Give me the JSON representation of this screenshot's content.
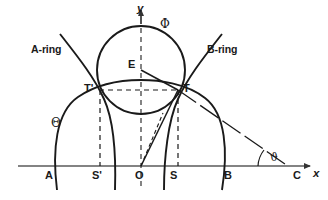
{
  "figure": {
    "kind": "geometry-diagram",
    "background_color": "#ffffff",
    "stroke_color": "#1a1a1a",
    "axis_color": "#555555"
  },
  "axes": {
    "x_label": "x",
    "y_label": "y",
    "origin_label": "O"
  },
  "points": {
    "A": "A",
    "S_prime": "S'",
    "O": "O",
    "S": "S",
    "B": "B",
    "C": "C",
    "T_prime": "T'",
    "T": "T",
    "E": "E"
  },
  "curves": {
    "a_ring": "A-ring",
    "b_ring": "B-ring",
    "theta": "Θ",
    "phi": "Φ"
  },
  "angles": {
    "theta_at_C": "ϑ"
  }
}
